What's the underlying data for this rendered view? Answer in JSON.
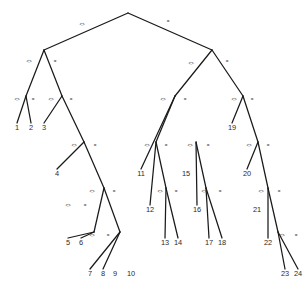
{
  "figure": {
    "type": "binary-decision-tree",
    "background_color": "#ffffff",
    "edge_color": "#1a1a1a",
    "text_color": "#2b2b2b",
    "width": 307,
    "height": 297,
    "left_branch_label": "<>",
    "right_branch_label": "=",
    "leaf_count": 24
  },
  "chart_data": {
    "type": "diagram",
    "title": "",
    "nodes": [
      {
        "id": "n0",
        "x": 128,
        "y": 13,
        "kind": "internal"
      },
      {
        "id": "n1",
        "x": 44,
        "y": 50,
        "kind": "internal"
      },
      {
        "id": "n2",
        "x": 212,
        "y": 50,
        "kind": "internal"
      },
      {
        "id": "n3",
        "x": 26,
        "y": 96,
        "kind": "internal"
      },
      {
        "id": "n4",
        "x": 62,
        "y": 96,
        "kind": "internal"
      },
      {
        "id": "n5",
        "x": 175,
        "y": 96,
        "kind": "internal"
      },
      {
        "id": "n6",
        "x": 243,
        "y": 96,
        "kind": "internal"
      },
      {
        "id": "n7",
        "x": 84,
        "y": 142,
        "kind": "internal"
      },
      {
        "id": "n8",
        "x": 156,
        "y": 142,
        "kind": "internal"
      },
      {
        "id": "n9",
        "x": 196,
        "y": 142,
        "kind": "internal"
      },
      {
        "id": "n10",
        "x": 258,
        "y": 142,
        "kind": "internal"
      },
      {
        "id": "n11",
        "x": 104,
        "y": 188,
        "kind": "internal"
      },
      {
        "id": "n12",
        "x": 166,
        "y": 188,
        "kind": "internal"
      },
      {
        "id": "n13",
        "x": 206,
        "y": 188,
        "kind": "internal"
      },
      {
        "id": "n14",
        "x": 268,
        "y": 188,
        "kind": "internal"
      },
      {
        "id": "n15",
        "x": 94,
        "y": 232,
        "kind": "internal"
      },
      {
        "id": "n16",
        "x": 120,
        "y": 232,
        "kind": "internal"
      },
      {
        "id": "n17",
        "x": 278,
        "y": 232,
        "kind": "internal"
      }
    ],
    "leaves": [
      {
        "label": "1",
        "x": 17,
        "y": 130
      },
      {
        "label": "2",
        "x": 31,
        "y": 130
      },
      {
        "label": "3",
        "x": 44,
        "y": 130
      },
      {
        "label": "4",
        "x": 57,
        "y": 176
      },
      {
        "label": "5",
        "x": 68,
        "y": 245
      },
      {
        "label": "6",
        "x": 81,
        "y": 245
      },
      {
        "label": "7",
        "x": 90,
        "y": 276
      },
      {
        "label": "8",
        "x": 103,
        "y": 276
      },
      {
        "label": "9",
        "x": 115,
        "y": 276
      },
      {
        "label": "10",
        "x": 131,
        "y": 276
      },
      {
        "label": "11",
        "x": 141,
        "y": 176
      },
      {
        "label": "12",
        "x": 150,
        "y": 212
      },
      {
        "label": "13",
        "x": 165,
        "y": 245
      },
      {
        "label": "14",
        "x": 178,
        "y": 245
      },
      {
        "label": "15",
        "x": 186,
        "y": 176
      },
      {
        "label": "16",
        "x": 197,
        "y": 212
      },
      {
        "label": "17",
        "x": 209,
        "y": 245
      },
      {
        "label": "18",
        "x": 222,
        "y": 245
      },
      {
        "label": "19",
        "x": 232,
        "y": 130
      },
      {
        "label": "20",
        "x": 247,
        "y": 176
      },
      {
        "label": "21",
        "x": 257,
        "y": 212
      },
      {
        "label": "22",
        "x": 268,
        "y": 245
      },
      {
        "label": "23",
        "x": 285,
        "y": 276
      },
      {
        "label": "24",
        "x": 298,
        "y": 276
      }
    ],
    "edges": [
      {
        "from": "n0",
        "to": "n1",
        "branch": "left",
        "label": "<>",
        "lx": 82,
        "ly": 25
      },
      {
        "from": "n0",
        "to": "n2",
        "branch": "right",
        "label": "=",
        "lx": 168,
        "ly": 22
      },
      {
        "from": "n1",
        "to": "n3",
        "branch": "left",
        "label": "<>",
        "lx": 29,
        "ly": 62
      },
      {
        "from": "n1",
        "to": "n4",
        "branch": "right",
        "label": "=",
        "lx": 55,
        "ly": 62
      },
      {
        "from": "n2",
        "to": "n5",
        "branch": "left",
        "label": "<>",
        "lx": 191,
        "ly": 64
      },
      {
        "from": "n2",
        "to": "n6",
        "branch": "right",
        "label": "=",
        "lx": 227,
        "ly": 62
      },
      {
        "from": "n3",
        "to": "1",
        "branch": "left",
        "label": "<>",
        "lx": 17,
        "ly": 100
      },
      {
        "from": "n3",
        "to": "2",
        "branch": "right",
        "label": "=",
        "lx": 33,
        "ly": 100
      },
      {
        "from": "n4",
        "to": "3",
        "branch": "left",
        "label": "<>",
        "lx": 51,
        "ly": 100
      },
      {
        "from": "n4",
        "to": "n7",
        "branch": "right",
        "label": "=",
        "lx": 71,
        "ly": 100
      },
      {
        "from": "n5",
        "to": "11",
        "branch": "left",
        "label": "<>",
        "lx": 163,
        "ly": 100
      },
      {
        "from": "n5",
        "to": "n8",
        "branch": "right",
        "label": "=",
        "lx": 185,
        "ly": 100
      },
      {
        "from": "n6",
        "to": "19",
        "branch": "left",
        "label": "<>",
        "lx": 234,
        "ly": 100
      },
      {
        "from": "n6",
        "to": "n10",
        "branch": "right",
        "label": "=",
        "lx": 252,
        "ly": 100
      },
      {
        "from": "n7",
        "to": "4",
        "branch": "left",
        "label": "<>",
        "lx": 74,
        "ly": 146
      },
      {
        "from": "n7",
        "to": "n11",
        "branch": "right",
        "label": "=",
        "lx": 95,
        "ly": 146
      },
      {
        "from": "n8",
        "to": "12",
        "branch": "left",
        "label": "<>",
        "lx": 147,
        "ly": 146
      },
      {
        "from": "n8",
        "to": "n12",
        "branch": "right",
        "label": "=",
        "lx": 166,
        "ly": 146
      },
      {
        "from": "n9",
        "to": "16",
        "branch": "left",
        "label": "<>",
        "lx": 190,
        "ly": 146
      },
      {
        "from": "n9",
        "to": "n13",
        "branch": "right",
        "label": "=",
        "lx": 208,
        "ly": 146
      },
      {
        "from": "n10",
        "to": "20",
        "branch": "left",
        "label": "<>",
        "lx": 249,
        "ly": 146
      },
      {
        "from": "n10",
        "to": "n14",
        "branch": "right",
        "label": "=",
        "lx": 268,
        "ly": 146
      },
      {
        "from": "n11",
        "to": "n15",
        "branch": "left",
        "label": "<>",
        "lx": 92,
        "ly": 192
      },
      {
        "from": "n11",
        "to": "n16",
        "branch": "right",
        "label": "=",
        "lx": 114,
        "ly": 192
      },
      {
        "from": "n12",
        "to": "13",
        "branch": "left",
        "label": "<>",
        "lx": 160,
        "ly": 192
      },
      {
        "from": "n12",
        "to": "14",
        "branch": "right",
        "label": "=",
        "lx": 176,
        "ly": 192
      },
      {
        "from": "n13",
        "to": "17",
        "branch": "left",
        "label": "<>",
        "lx": 204,
        "ly": 192
      },
      {
        "from": "n13",
        "to": "18",
        "branch": "right",
        "label": "=",
        "lx": 220,
        "ly": 192
      },
      {
        "from": "n14",
        "to": "22",
        "branch": "left",
        "label": "<>",
        "lx": 261,
        "ly": 192
      },
      {
        "from": "n14",
        "to": "n17",
        "branch": "right",
        "label": "=",
        "lx": 279,
        "ly": 192
      },
      {
        "from": "n15",
        "to": "5",
        "branch": "left",
        "label": "<>",
        "lx": 68,
        "ly": 206
      },
      {
        "from": "n15",
        "to": "6",
        "branch": "right",
        "label": "=",
        "lx": 85,
        "ly": 206
      },
      {
        "from": "n16",
        "to": "7",
        "branch": "left",
        "label": "<>",
        "lx": 92,
        "ly": 236
      },
      {
        "from": "n16",
        "to": "8",
        "branch": "right",
        "label": "=",
        "lx": 108,
        "ly": 236
      },
      {
        "from": "n17",
        "to": "23",
        "branch": "left",
        "label": "<>",
        "lx": 282,
        "ly": 236
      },
      {
        "from": "n17",
        "to": "24",
        "branch": "right",
        "label": "=",
        "lx": 296,
        "ly": 236
      }
    ]
  }
}
